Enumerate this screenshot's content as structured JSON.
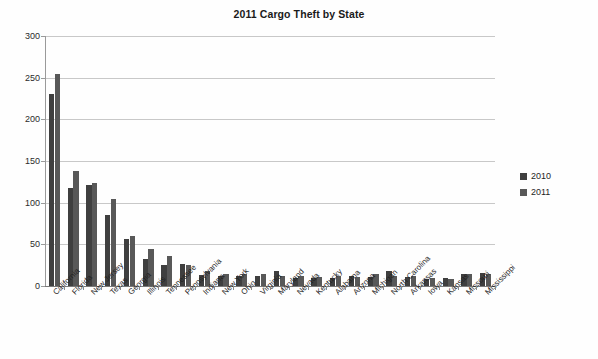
{
  "chart_data": {
    "type": "bar",
    "title": "2011 Cargo Theft by State",
    "xlabel": "",
    "ylabel": "",
    "ylim": [
      0,
      300
    ],
    "yticks": [
      0,
      50,
      100,
      150,
      200,
      250,
      300
    ],
    "grid": true,
    "legend_position": "right",
    "categories": [
      "California",
      "Florida",
      "New Jersey",
      "Texas",
      "Georgia",
      "Illinois",
      "Tennessee",
      "Pennsylvania",
      "Indiana",
      "New York",
      "Ohio",
      "Virginia",
      "Maryland",
      "Nevada",
      "Kentucky",
      "Alabama",
      "Arizona",
      "Michigan",
      "North Carolina",
      "Arkansas",
      "Iowa",
      "Kansas",
      "Missouri",
      "Mississippi"
    ],
    "series": [
      {
        "name": "2010",
        "color": "#3f3f3f",
        "values": [
          230,
          118,
          121,
          85,
          57,
          33,
          25,
          27,
          13,
          12,
          12,
          12,
          18,
          10,
          10,
          10,
          12,
          11,
          18,
          11,
          9,
          10,
          14,
          16
        ]
      },
      {
        "name": "2011",
        "color": "#585858",
        "values": [
          255,
          138,
          124,
          105,
          60,
          45,
          36,
          25,
          18,
          15,
          14,
          14,
          12,
          12,
          11,
          12,
          11,
          15,
          12,
          12,
          10,
          9,
          14,
          14
        ]
      }
    ]
  },
  "legend": {
    "items": [
      {
        "label": "2010",
        "color": "#3f3f3f"
      },
      {
        "label": "2011",
        "color": "#585858"
      }
    ]
  }
}
